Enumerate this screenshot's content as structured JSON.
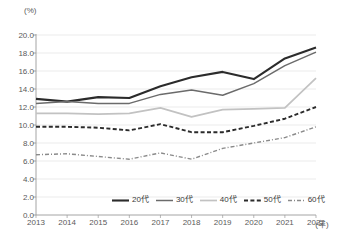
{
  "chart_data": {
    "type": "line",
    "title": "",
    "subtitle": "",
    "xlabel": "年",
    "ylabel": "%",
    "unit_label": "(%)",
    "x_unit_label": "(年)",
    "grid": true,
    "legend_position": "bottom",
    "categories": [
      "2013",
      "2014",
      "2015",
      "2016",
      "2017",
      "2018",
      "2019",
      "2020",
      "2021",
      "2022"
    ],
    "xlim": [
      2013,
      2022
    ],
    "ylim": [
      0.0,
      20.0
    ],
    "ytick_labels": [
      "20.0",
      "18.0",
      "16.0",
      "14.0",
      "12.0",
      "10.0",
      "8.0",
      "6.0",
      "4.0",
      "2.0",
      "0.0"
    ],
    "ytick_values": [
      20.0,
      18.0,
      16.0,
      14.0,
      12.0,
      10.0,
      8.0,
      6.0,
      4.0,
      2.0,
      0.0
    ],
    "series": [
      {
        "name": "20代",
        "color": "#2b2b2b",
        "style": "solid",
        "width": 2.1,
        "values": [
          12.9,
          12.6,
          13.1,
          13.0,
          14.3,
          15.3,
          15.9,
          15.1,
          17.4,
          18.6
        ]
      },
      {
        "name": "30代",
        "color": "#6b6b6b",
        "style": "solid",
        "width": 1.5,
        "values": [
          12.4,
          12.6,
          12.4,
          12.4,
          13.4,
          13.9,
          13.3,
          14.6,
          16.6,
          18.1
        ]
      },
      {
        "name": "40代",
        "color": "#c2c2c2",
        "style": "solid",
        "width": 1.7,
        "values": [
          11.3,
          11.3,
          11.2,
          11.3,
          11.9,
          10.9,
          11.7,
          11.8,
          11.9,
          15.2
        ]
      },
      {
        "name": "50代",
        "color": "#2b2b2b",
        "style": "dashed",
        "width": 1.9,
        "values": [
          9.8,
          9.8,
          9.7,
          9.4,
          10.1,
          9.2,
          9.2,
          9.9,
          10.7,
          12.0
        ]
      },
      {
        "name": "60代",
        "color": "#8a8a8a",
        "style": "dashdot",
        "width": 1.4,
        "values": [
          6.7,
          6.8,
          6.5,
          6.2,
          6.9,
          6.2,
          7.4,
          8.0,
          8.6,
          9.8
        ]
      }
    ]
  },
  "legend": {
    "items": [
      {
        "label": "20代"
      },
      {
        "label": "30代"
      },
      {
        "label": "40代"
      },
      {
        "label": "50代"
      },
      {
        "label": "60代"
      }
    ]
  }
}
